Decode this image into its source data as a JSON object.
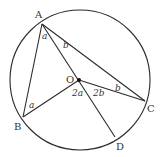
{
  "diagram": {
    "circle": {
      "cx": 80,
      "cy": 80,
      "r": 70
    },
    "points": {
      "A": {
        "x": 42,
        "y": 24,
        "label": "A",
        "lx": 35,
        "ly": 18
      },
      "B": {
        "x": 23,
        "y": 117,
        "label": "B",
        "lx": 14,
        "ly": 130
      },
      "C": {
        "x": 145,
        "y": 101,
        "label": "C",
        "lx": 147,
        "ly": 112
      },
      "D": {
        "x": 115,
        "y": 137,
        "label": "D",
        "lx": 116,
        "ly": 150
      },
      "O": {
        "x": 79,
        "y": 80,
        "label": "O",
        "lx": 66,
        "ly": 83
      }
    },
    "segments": [
      [
        "A",
        "B"
      ],
      [
        "A",
        "C"
      ],
      [
        "A",
        "D"
      ],
      [
        "O",
        "B"
      ],
      [
        "O",
        "C"
      ]
    ],
    "angle_labels": [
      {
        "text": "a",
        "x": 42,
        "y": 39
      },
      {
        "text": "b",
        "x": 63,
        "y": 48
      },
      {
        "text": "a",
        "x": 29,
        "y": 108
      },
      {
        "text": "b",
        "x": 115,
        "y": 91
      },
      {
        "text": "2a",
        "x": 72,
        "y": 96
      },
      {
        "text": "2b",
        "x": 93,
        "y": 96
      }
    ]
  }
}
